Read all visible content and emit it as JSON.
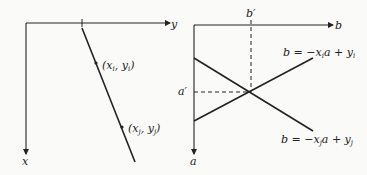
{
  "left_panel": {
    "horizontal_axis_label": "y",
    "vertical_axis_label": "x",
    "points": [
      {
        "label_x": "x",
        "sub_x": "i",
        "label_y": "y",
        "sub_y": "i"
      },
      {
        "label_x": "x",
        "sub_x": "j",
        "label_y": "y",
        "sub_y": "j"
      }
    ]
  },
  "right_panel": {
    "horizontal_axis_label": "b",
    "vertical_axis_label": "a",
    "intersection_b_label": "b′",
    "intersection_a_label": "a′",
    "lines": [
      {
        "eq_prefix": "b = −x",
        "sub": "i",
        "eq_mid": "a + y",
        "sub2": "i"
      },
      {
        "eq_prefix": "b = −x",
        "sub": "j",
        "eq_mid": "a + y",
        "sub2": "j"
      }
    ]
  },
  "colors": {
    "ink": "#222222",
    "background": "#fafaf8"
  }
}
